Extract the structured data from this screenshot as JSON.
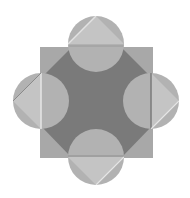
{
  "diagram": {
    "title": "",
    "colors": {
      "background": "#ffffff",
      "outer_square": "#a8a8a8",
      "inner_octagon": "#7a7a7a",
      "circle": "#b2b2b2",
      "triangle": "#c2c2c2",
      "edge_light": "#e0e0e0",
      "edge_dark": "#6a6a6a"
    },
    "square": {
      "x": 40,
      "y": 47,
      "w": 113,
      "h": 111
    },
    "octagon_points": "72,47 121,47 153,79 153,125 121,158 72,158 40,125 40,79",
    "circles": [
      {
        "name": "top",
        "cx": 96,
        "cy": 44,
        "r": 28
      },
      {
        "name": "left",
        "cx": 41,
        "cy": 101,
        "r": 28
      },
      {
        "name": "right",
        "cx": 151,
        "cy": 101,
        "r": 28
      },
      {
        "name": "bottom",
        "cx": 96,
        "cy": 157,
        "r": 28
      }
    ]
  }
}
